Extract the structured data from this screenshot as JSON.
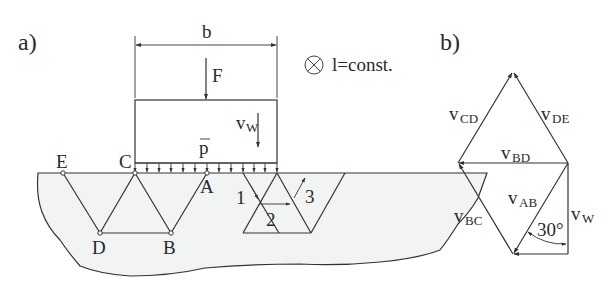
{
  "figure": {
    "panel_a": {
      "label": "a)",
      "width_label": "b",
      "force_label": "F",
      "pressure_label": "p",
      "velocity_label": "v",
      "velocity_sub": "W",
      "out_of_plane_note": "l=const.",
      "nodes": {
        "E": "E",
        "C": "C",
        "A": "A",
        "D": "D",
        "B": "B"
      },
      "mechanism_labels": [
        "1",
        "2",
        "3"
      ]
    },
    "panel_b": {
      "label": "b)",
      "v_main": "v",
      "subs": {
        "CD": "CD",
        "DE": "DE",
        "BD": "BD",
        "BC": "BC",
        "AB": "AB",
        "W": "W"
      },
      "angle": "30°"
    },
    "colors": {
      "line": "#333333",
      "soil_fill": "#f2f4f4",
      "text": "#2a2a2a"
    }
  }
}
